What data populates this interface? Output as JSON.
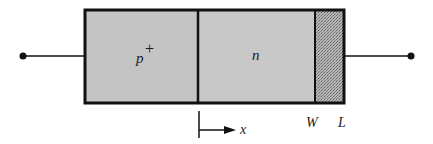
{
  "diagram": {
    "type": "pn-diode-cross-section",
    "regions": [
      {
        "name": "p-plus-region",
        "label": "p",
        "superscript": "+",
        "fill": "#c4c4c4"
      },
      {
        "name": "n-region",
        "label": "n",
        "fill": "#c8c8c8"
      },
      {
        "name": "contact-region",
        "label": "",
        "fill": "#a8a8a8"
      }
    ],
    "axis": {
      "label": "x"
    },
    "markers": {
      "w_label": "W",
      "l_label": "L"
    },
    "colors": {
      "outline": "#111111",
      "region_fill": "#c6c6c6",
      "stipple_fill": "#a6a6a6"
    }
  }
}
